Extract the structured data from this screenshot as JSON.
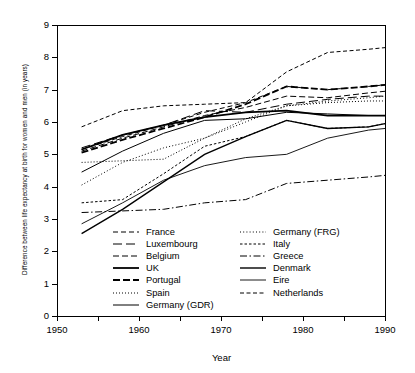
{
  "chart_data": {
    "type": "line",
    "title": "",
    "xlabel": "Year",
    "ylabel": "Difference between life expectancy at birth for women and men (in years)",
    "xlim": [
      1950,
      1990
    ],
    "ylim": [
      0,
      9
    ],
    "xticks": [
      1950,
      1955,
      1960,
      1965,
      1970,
      1975,
      1980,
      1985,
      1990
    ],
    "xticklabels": [
      "1950",
      "",
      "1960",
      "",
      "1970",
      "",
      "1980",
      "",
      "1990"
    ],
    "yticks": [
      0,
      1,
      2,
      3,
      4,
      5,
      6,
      7,
      8,
      9
    ],
    "yticklabels": [
      "0",
      "1",
      "2",
      "3",
      "4",
      "5",
      "6",
      "7",
      "8",
      "9"
    ],
    "grid": false,
    "legend_position": "lower-center-inside",
    "legend_columns": 2,
    "series": [
      {
        "name": "France",
        "style": "dashed",
        "dasharray": "5,3",
        "width": 1.0,
        "x": [
          1953,
          1958,
          1963,
          1968,
          1973,
          1978,
          1983,
          1988,
          1990
        ],
        "y": [
          5.15,
          5.55,
          5.9,
          6.3,
          6.6,
          7.1,
          7.0,
          7.1,
          7.15
        ]
      },
      {
        "name": "Luxembourg",
        "style": "long-dash",
        "dasharray": "9,4",
        "width": 1.0,
        "x": [
          1953,
          1958,
          1963,
          1968,
          1973,
          1978,
          1983,
          1988,
          1990
        ],
        "y": [
          5.2,
          5.6,
          5.9,
          6.35,
          6.3,
          6.55,
          6.7,
          6.8,
          6.8
        ]
      },
      {
        "name": "Belgium",
        "style": "dashed",
        "dasharray": "6,3",
        "width": 1.0,
        "x": [
          1953,
          1958,
          1963,
          1968,
          1973,
          1978,
          1983,
          1988,
          1990
        ],
        "y": [
          5.1,
          5.5,
          5.85,
          6.2,
          6.45,
          6.8,
          6.75,
          6.9,
          6.95
        ]
      },
      {
        "name": "UK",
        "style": "solid",
        "dasharray": "",
        "width": 1.8,
        "x": [
          1953,
          1958,
          1963,
          1968,
          1973,
          1978,
          1983,
          1988,
          1990
        ],
        "y": [
          5.15,
          5.6,
          5.9,
          6.15,
          6.3,
          6.35,
          6.2,
          6.2,
          6.2
        ]
      },
      {
        "name": "Portugal",
        "style": "dashed-bold",
        "dasharray": "7,3",
        "width": 1.8,
        "x": [
          1953,
          1958,
          1963,
          1968,
          1973,
          1978,
          1983,
          1988,
          1990
        ],
        "y": [
          5.05,
          5.45,
          5.8,
          6.15,
          6.55,
          7.1,
          7.0,
          7.1,
          7.15
        ]
      },
      {
        "name": "Spain",
        "style": "dotted",
        "dasharray": "1,2",
        "width": 1.0,
        "x": [
          1953,
          1958,
          1963,
          1968,
          1973,
          1978,
          1983,
          1988,
          1990
        ],
        "y": [
          4.75,
          4.8,
          4.85,
          5.5,
          6.1,
          6.5,
          6.6,
          6.65,
          6.65
        ]
      },
      {
        "name": "Germany (GDR)",
        "style": "solid",
        "dasharray": "",
        "width": 1.0,
        "x": [
          1953,
          1958,
          1963,
          1968,
          1973,
          1978,
          1983,
          1988,
          1990
        ],
        "y": [
          4.45,
          5.1,
          5.65,
          6.05,
          6.1,
          6.3,
          6.25,
          6.2,
          6.2
        ]
      },
      {
        "name": "Germany (FRG)",
        "style": "fine-dotted",
        "dasharray": "1,2.2",
        "width": 1.0,
        "x": [
          1953,
          1958,
          1963,
          1968,
          1973,
          1978,
          1983,
          1988,
          1990
        ],
        "y": [
          4.05,
          4.75,
          5.2,
          5.5,
          6.0,
          6.5,
          6.65,
          6.75,
          6.8
        ]
      },
      {
        "name": "Italy",
        "style": "fine-dashed",
        "dasharray": "2.5,2",
        "width": 1.0,
        "x": [
          1953,
          1958,
          1963,
          1968,
          1973,
          1978,
          1983,
          1988,
          1990
        ],
        "y": [
          3.5,
          3.6,
          4.4,
          5.25,
          5.55,
          6.05,
          5.8,
          5.85,
          5.95
        ]
      },
      {
        "name": "Greece",
        "style": "dash-dot",
        "dasharray": "7,2.5,1.5,2.5",
        "width": 1.0,
        "x": [
          1953,
          1958,
          1963,
          1968,
          1973,
          1978,
          1983,
          1988,
          1990
        ],
        "y": [
          3.2,
          3.25,
          3.3,
          3.5,
          3.6,
          4.1,
          4.2,
          4.3,
          4.35
        ]
      },
      {
        "name": "Denmark",
        "style": "solid-bold",
        "dasharray": "",
        "width": 1.4,
        "x": [
          1953,
          1958,
          1963,
          1968,
          1973,
          1978,
          1983,
          1988,
          1990
        ],
        "y": [
          2.55,
          3.3,
          4.15,
          5.0,
          5.55,
          6.05,
          5.8,
          5.85,
          5.95
        ]
      },
      {
        "name": "Eire",
        "style": "solid-thin",
        "dasharray": "",
        "width": 0.9,
        "x": [
          1953,
          1958,
          1963,
          1968,
          1973,
          1978,
          1983,
          1988,
          1990
        ],
        "y": [
          2.85,
          3.5,
          4.2,
          4.65,
          4.9,
          5.0,
          5.5,
          5.75,
          5.8
        ]
      },
      {
        "name": "Netherlands",
        "style": "sparse-dashed",
        "dasharray": "4,2.5",
        "width": 1.0,
        "x": [
          1953,
          1958,
          1963,
          1968,
          1973,
          1978,
          1983,
          1988,
          1990
        ],
        "y": [
          5.85,
          6.35,
          6.5,
          6.55,
          6.6,
          7.55,
          8.15,
          8.25,
          8.3
        ]
      }
    ]
  },
  "legend": {
    "left_column": [
      {
        "label": "France"
      },
      {
        "label": "Luxembourg"
      },
      {
        "label": "Belgium"
      },
      {
        "label": "UK"
      },
      {
        "label": "Portugal"
      },
      {
        "label": "Spain"
      },
      {
        "label": "Germany (GDR)"
      }
    ],
    "right_column": [
      {
        "label": "Germany (FRG)"
      },
      {
        "label": "Italy"
      },
      {
        "label": "Greece"
      },
      {
        "label": "Denmark"
      },
      {
        "label": "Eire"
      },
      {
        "label": "Netherlands"
      }
    ]
  },
  "colors": {
    "line": "#000000",
    "axis": "#000000",
    "background": "#ffffff"
  }
}
